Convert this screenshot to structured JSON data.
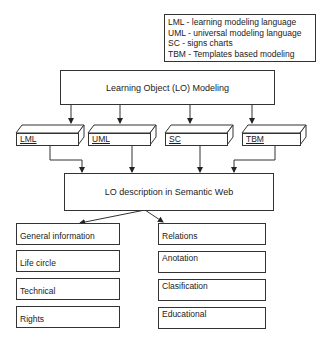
{
  "legend": {
    "lines": [
      "LML - learning modeling language",
      "UML - universal modeling language",
      "SC - signs charts",
      "TBM - Templates based modeling"
    ]
  },
  "modeling_box": {
    "label": "Learning Object (LO) Modeling"
  },
  "languages": [
    {
      "label": "LML"
    },
    {
      "label": "UML"
    },
    {
      "label": "SC"
    },
    {
      "label": "TBM"
    }
  ],
  "description_box": {
    "label": "LO description in Semantic Web"
  },
  "left_categories": [
    {
      "label": "General information"
    },
    {
      "label": "Life circle"
    },
    {
      "label": "Technical"
    },
    {
      "label": "Rights"
    }
  ],
  "right_categories": [
    {
      "label": "Relations"
    },
    {
      "label": "Anotation"
    },
    {
      "label": "Clasification"
    },
    {
      "label": "Educational"
    }
  ]
}
